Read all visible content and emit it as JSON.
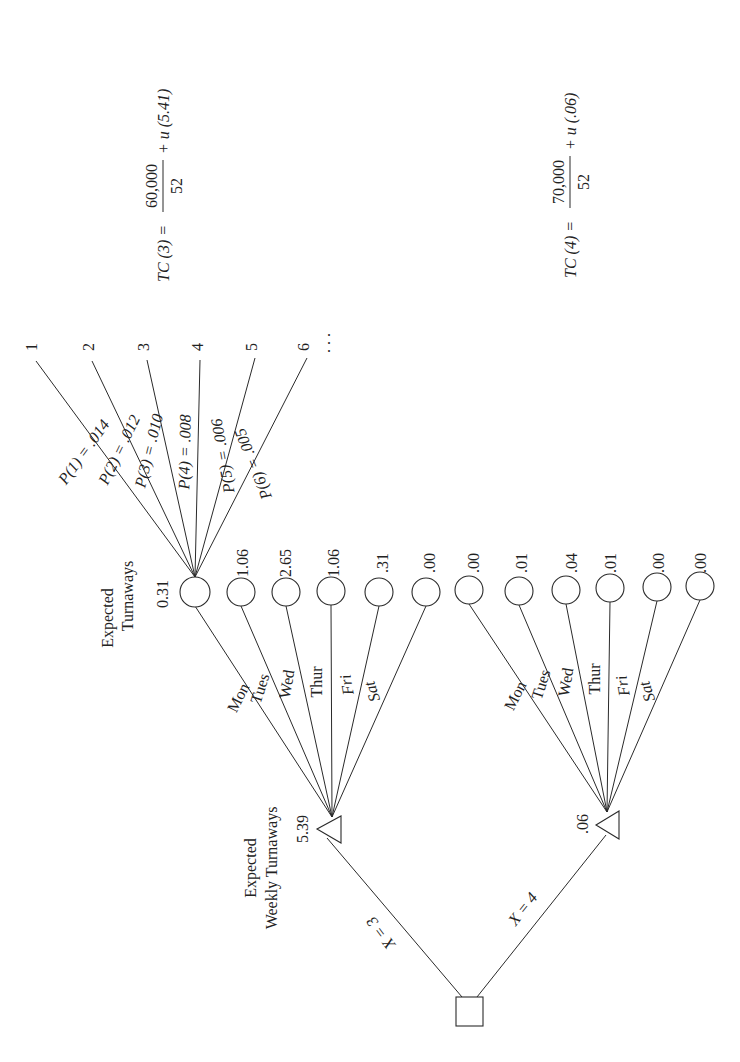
{
  "diagram": {
    "type": "decision-tree",
    "orientation": "rotated-90-ccw",
    "colors": {
      "ink": "#2a2a2a",
      "background": "#ffffff"
    },
    "decision_node": {
      "label": "",
      "x": 456,
      "y": 997,
      "w": 27,
      "h": 29
    },
    "decision_branches": [
      {
        "label": "X = 3",
        "to": "demand_node_3"
      },
      {
        "label": "X = 4",
        "to": "demand_node_4"
      }
    ],
    "demand_nodes": [
      {
        "id": "demand_node_3",
        "value": "5.39",
        "caption_line1": "Expected",
        "caption_line2": "Weekly Turnaways"
      },
      {
        "id": "demand_node_4",
        "value": ".06"
      }
    ],
    "day_groups": [
      {
        "group": "X = 3",
        "days": [
          {
            "label": "Mon",
            "italic": false,
            "expected_turnaways": "0.31"
          },
          {
            "label": "Tues",
            "italic": false,
            "expected_turnaways": "1.06"
          },
          {
            "label": "Wed",
            "italic": false,
            "expected_turnaways": "2.65"
          },
          {
            "label": "Thur",
            "italic": false,
            "expected_turnaways": "1.06"
          },
          {
            "label": "Fri",
            "italic": true,
            "expected_turnaways": ".31"
          },
          {
            "label": "Sat",
            "italic": true,
            "expected_turnaways": ".00"
          }
        ]
      },
      {
        "group": "X = 4",
        "days": [
          {
            "label": "Mon",
            "italic": false,
            "expected_turnaways": ".00"
          },
          {
            "label": "Tues",
            "italic": false,
            "expected_turnaways": ".01"
          },
          {
            "label": "Wed",
            "italic": false,
            "expected_turnaways": ".04"
          },
          {
            "label": "Thur",
            "italic": false,
            "expected_turnaways": ".01"
          },
          {
            "label": "Fri",
            "italic": true,
            "expected_turnaways": ".00"
          },
          {
            "label": "Sat",
            "italic": true,
            "expected_turnaways": ".00"
          }
        ]
      }
    ],
    "chance_caption": {
      "line1": "Expected",
      "line2": "Turnaways"
    },
    "outcome_fan": {
      "branches": [
        {
          "label": "P(1) = .014",
          "outcome": "1"
        },
        {
          "label": "P(2) = .012",
          "outcome": "2"
        },
        {
          "label": "P(3) = .010",
          "outcome": "3"
        },
        {
          "label": "P(4) = .008",
          "outcome": "4"
        },
        {
          "label": "P(5) = .006",
          "outcome": "5"
        },
        {
          "label": "P(6) = .005",
          "outcome": "6"
        }
      ],
      "ellipsis": ". . ."
    },
    "equations": [
      {
        "lhs": "TC (3) =",
        "numerator": "60,000",
        "denominator": "52",
        "rhs": "+ u (5.41)"
      },
      {
        "lhs": "TC (4) =",
        "numerator": "70,000",
        "denominator": "52",
        "rhs": "+ u (.06)"
      }
    ]
  }
}
